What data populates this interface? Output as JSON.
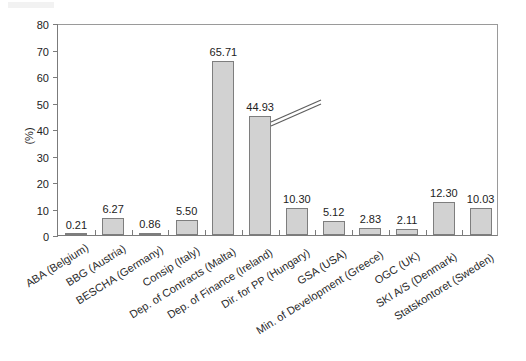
{
  "chart_data": {
    "type": "bar",
    "title": "",
    "xlabel": "",
    "ylabel": "(%)",
    "ylim": [
      0,
      80
    ],
    "ytick_step": 10,
    "yticks": [
      "80",
      "70",
      "60",
      "50",
      "40",
      "30",
      "20",
      "10",
      "0"
    ],
    "grid": false,
    "legend": "none",
    "bar_color": "#d2d2d2",
    "bar_border_color": "#7e7e7e",
    "axis_color": "#7b7b7b",
    "has_axis_break": true,
    "axis_break_note": "double-slash break drawn across the tallest bar",
    "categories": [
      "ABA (Belgium)",
      "BBG  (Austria)",
      "BESCHA (Germany)",
      "Consip  (Italy)",
      "Dep. of Contracts (Malta)",
      "Dep. of Finance (Ireland)",
      "Dir. for PP (Hungary)",
      "GSA  (USA)",
      "Min. of Development (Greece)",
      "OGC (UK)",
      "SKI A/S  (Denmark)",
      "Statskontoret  (Sweden)"
    ],
    "values": [
      0.21,
      6.27,
      0.86,
      5.5,
      65.71,
      44.93,
      10.3,
      5.12,
      2.83,
      2.11,
      12.3,
      10.03
    ],
    "value_labels": [
      "0.21",
      "6.27",
      "0.86",
      "5.50",
      "65.71",
      "44.93",
      "10.30",
      "5.12",
      "2.83",
      "2.11",
      "12.30",
      "10.03"
    ]
  }
}
